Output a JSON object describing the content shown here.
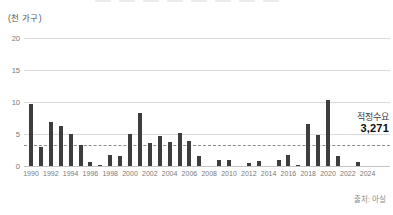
{
  "unit_label": "(천 가구)",
  "annotation": {
    "label": "적정수요",
    "value": "3,271"
  },
  "source": "출처: 아실",
  "colors": {
    "bar": "#3d3d3d",
    "gridline": "#d9d9d9",
    "dashed_line": "#8c8c8c",
    "tick_text": "#7a7a7a"
  },
  "chart_data": {
    "type": "bar",
    "title": "",
    "ylabel": "(천 가구)",
    "xlabel": "",
    "ylim": [
      0,
      20
    ],
    "yticks": [
      0,
      5,
      10,
      15,
      20
    ],
    "grid": true,
    "x": [
      1990,
      1991,
      1992,
      1993,
      1994,
      1995,
      1996,
      1997,
      1998,
      1999,
      2000,
      2001,
      2002,
      2003,
      2004,
      2005,
      2006,
      2007,
      2008,
      2009,
      2010,
      2011,
      2012,
      2013,
      2014,
      2015,
      2016,
      2017,
      2018,
      2019,
      2020,
      2021,
      2022,
      2023,
      2024
    ],
    "values": [
      9.7,
      2.9,
      6.8,
      6.2,
      5.0,
      3.3,
      0.6,
      0.2,
      1.7,
      1.6,
      5.0,
      8.3,
      3.6,
      4.7,
      3.7,
      5.1,
      3.9,
      1.6,
      0,
      1.0,
      1.0,
      0,
      0.5,
      0.8,
      0,
      0.9,
      1.7,
      0.2,
      6.6,
      4.8,
      10.3,
      1.6,
      0,
      0.6,
      0
    ],
    "xtick_labels": [
      "1990",
      "1992",
      "1994",
      "1996",
      "1998",
      "2000",
      "2002",
      "2004",
      "2006",
      "2008",
      "2010",
      "2012",
      "2014",
      "2016",
      "2018",
      "2020",
      "2022",
      "2024"
    ],
    "target_line": {
      "label": "적정수요",
      "value": 3.271,
      "style": "dashed"
    },
    "legend": null
  }
}
